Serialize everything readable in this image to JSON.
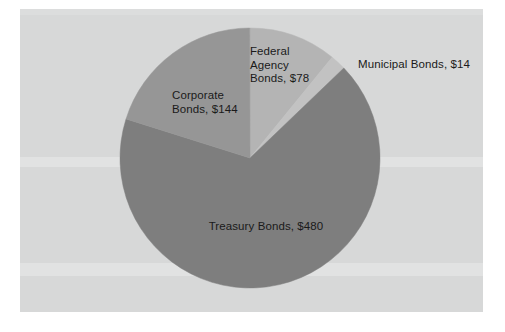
{
  "chart_data": {
    "type": "pie",
    "title": "",
    "subtitle": "",
    "xlabel": "",
    "ylabel": "",
    "legend_position": "none",
    "grid": false,
    "label_format": "{category}, ${value}",
    "units": "USD (billions)",
    "total": 716,
    "categories": [
      "Federal Agency Bonds",
      "Municipal Bonds",
      "Treasury Bonds",
      "Corporate Bonds"
    ],
    "values": [
      78,
      14,
      480,
      144
    ],
    "slices": [
      {
        "name": "federal-agency-bonds",
        "category": "Federal Agency Bonds",
        "value": 78,
        "value_text": "$78",
        "label": "Federal\nAgency\nBonds, $78",
        "percent": 10.9,
        "start_angle_deg": 0.0,
        "sweep_deg": 39.2,
        "color": "#b4b4b4"
      },
      {
        "name": "municipal-bonds",
        "category": "Municipal Bonds",
        "value": 14,
        "value_text": "$14",
        "label": "Municipal Bonds, $14",
        "percent": 2.0,
        "start_angle_deg": 39.2,
        "sweep_deg": 7.0,
        "color": "#c2c2c2"
      },
      {
        "name": "treasury-bonds",
        "category": "Treasury Bonds",
        "value": 480,
        "value_text": "$480",
        "label": "Treasury Bonds, $480",
        "percent": 67.0,
        "start_angle_deg": 46.2,
        "sweep_deg": 241.3,
        "color": "#7e7e7e"
      },
      {
        "name": "corporate-bonds",
        "category": "Corporate Bonds",
        "value": 144,
        "value_text": "$144",
        "label": "Corporate\nBonds, $144",
        "percent": 20.1,
        "start_angle_deg": 287.5,
        "sweep_deg": 72.4,
        "color": "#969696"
      }
    ],
    "plot_background": "#d7d8d8",
    "label_color": "#1a1a1a"
  }
}
